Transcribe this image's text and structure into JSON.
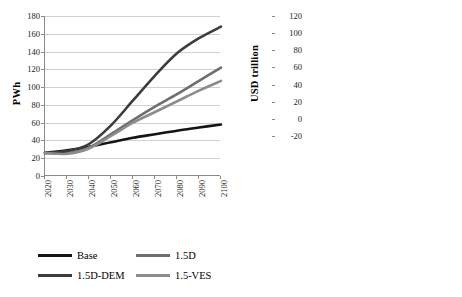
{
  "chart_data": [
    {
      "type": "line",
      "id": "primary-energy-lines",
      "title": "",
      "xlabel": "",
      "ylabel": "PWh",
      "xlim": [
        2020,
        2100
      ],
      "ylim": [
        0,
        180
      ],
      "ytick_step": 20,
      "grid": true,
      "legend_position": "bottom",
      "x": [
        2020,
        2030,
        2040,
        2050,
        2060,
        2070,
        2080,
        2090,
        2100
      ],
      "yticks": [
        "0",
        "20",
        "40",
        "60",
        "80",
        "100",
        "120",
        "140",
        "160",
        "180"
      ],
      "xticks": [
        "2020",
        "2030",
        "2040",
        "2050",
        "2060",
        "2070",
        "2080",
        "2090",
        "2100"
      ],
      "series": [
        {
          "name": "Base",
          "color": "#141414",
          "width": 2.6,
          "values": [
            26,
            29,
            33,
            38,
            43,
            47,
            51,
            54.5,
            58
          ]
        },
        {
          "name": "1.5D",
          "color": "#6e6e6e",
          "width": 2.6,
          "values": [
            26,
            25.5,
            32,
            47,
            63,
            78,
            92,
            107,
            122
          ]
        },
        {
          "name": "1.5D-DEM",
          "color": "#3c3c3c",
          "width": 2.6,
          "values": [
            26,
            28,
            36,
            57,
            85,
            113,
            138,
            155,
            168
          ]
        },
        {
          "name": "1.5-VES",
          "color": "#8c8c8c",
          "width": 2.6,
          "values": [
            26,
            25,
            31,
            45,
            60,
            72,
            84,
            96,
            107
          ]
        }
      ]
    },
    {
      "type": "bar",
      "id": "investment-stacked-bars",
      "subtype": "stacked",
      "title": "",
      "xlabel": "",
      "ylabel": "USD trillion",
      "ylim": [
        -20,
        120
      ],
      "ytick_step": 20,
      "grid": true,
      "legend_position": "bottom",
      "yticks": [
        "-20",
        "0",
        "20",
        "40",
        "60",
        "80",
        "100",
        "120"
      ],
      "periods": [
        "2020-\n2040",
        "2040-\n2060",
        "2060-\n2080",
        "2080-\n2100"
      ],
      "period_labels": [
        {
          "line1": "2020-",
          "line2": "2040"
        },
        {
          "line1": "2040-",
          "line2": "2060"
        },
        {
          "line1": "2060-",
          "line2": "2080"
        },
        {
          "line1": "2080-",
          "line2": "2100"
        }
      ],
      "scenarios": [
        "1.5D",
        "1.5D-DEM",
        "1.5D-VES"
      ],
      "categories": [
        "2020-2040 / 1.5D",
        "2020-2040 / 1.5D-DEM",
        "2020-2040 / 1.5D-VES",
        "2040-2060 / 1.5D",
        "2040-2060 / 1.5D-DEM",
        "2040-2060 / 1.5D-VES",
        "2060-2080 / 1.5D",
        "2060-2080 / 1.5D-DEM",
        "2060-2080 / 1.5D-VES",
        "2080-2100 / 1.5D",
        "2080-2100 / 1.5D-DEM",
        "2080-2100 / 1.5D-VES"
      ],
      "series": [
        {
          "name": "Coal w/o CCS",
          "color": "#101010",
          "values": [
            -3.5,
            -2.0,
            -3.0,
            -5.0,
            -5.5,
            -5.0,
            -5.5,
            -6.0,
            -5.5,
            -5.5,
            -6.0,
            -6.0
          ]
        },
        {
          "name": "Gas w/o CCS",
          "color": "#5a5a5a",
          "values": [
            1.0,
            1.0,
            1.0,
            1.0,
            1.0,
            1.0,
            1.0,
            1.0,
            1.0,
            1.0,
            1.0,
            1.0
          ]
        },
        {
          "name": "Fossil CCS",
          "color": "#c4c4c4",
          "values": [
            3.0,
            4.0,
            3.0,
            6.0,
            7.0,
            6.0,
            7.0,
            8.0,
            7.0,
            7.0,
            9.0,
            8.0
          ]
        },
        {
          "name": "Nuclear",
          "color": "#6b6b6b",
          "values": [
            1.5,
            1.5,
            1.5,
            2.0,
            2.0,
            2.0,
            2.0,
            2.0,
            2.0,
            2.0,
            2.0,
            2.0
          ]
        },
        {
          "name": "Renewables",
          "color": "#3a3a3a",
          "values": [
            9.5,
            22.5,
            9.5,
            28.0,
            53.0,
            24.5,
            39.5,
            98.0,
            37.5,
            43.0,
            104.5,
            63.0
          ]
        },
        {
          "name": "BECCS",
          "color": "#2b2b2b",
          "values": [
            0.0,
            0.0,
            0.0,
            1.0,
            1.0,
            1.0,
            1.0,
            1.5,
            1.0,
            1.0,
            1.5,
            1.0
          ]
        }
      ],
      "bar_totals": [
        15,
        29,
        15,
        38,
        64,
        34.5,
        50,
        110.5,
        48.5,
        53.5,
        117,
        75
      ]
    }
  ],
  "left_chart": {
    "y_axis_title": "PWh",
    "y_ticks": [
      "180",
      "160",
      "140",
      "120",
      "100",
      "80",
      "60",
      "40",
      "20",
      "0"
    ],
    "x_ticks": [
      "2020",
      "2030",
      "2040",
      "2050",
      "2060",
      "2070",
      "2080",
      "2090",
      "2100"
    ],
    "legend": [
      {
        "label": "Base",
        "color": "#141414"
      },
      {
        "label": "1.5D",
        "color": "#6e6e6e"
      },
      {
        "label": "1.5D-DEM",
        "color": "#3c3c3c"
      },
      {
        "label": "1.5-VES",
        "color": "#8c8c8c"
      }
    ]
  },
  "right_chart": {
    "y_axis_title": "USD trillion",
    "y_ticks": [
      "120",
      "100",
      "80",
      "60",
      "40",
      "20",
      "0",
      "-20"
    ],
    "scenario_labels": [
      "1.5D",
      "1.5D-DEM",
      "1.5D-VES",
      "1.5D",
      "1.5D-DEM",
      "1.5D-VES",
      "1.5D",
      "1.5D-DEM",
      "1.5D-VES",
      "1.5D",
      "1.5D-DEM",
      "1.5D-VES"
    ],
    "period_line1": [
      "2020-",
      "2040-",
      "2060-",
      "2080-"
    ],
    "period_line2": [
      "2040",
      "2060",
      "2080",
      "2100"
    ],
    "legend": [
      {
        "label": "Coal w/o CCS",
        "color": "#101010"
      },
      {
        "label": "Gas w/o CCS",
        "color": "#5a5a5a"
      },
      {
        "label": "Fossil CCS",
        "color": "#c4c4c4"
      },
      {
        "label": "Nuclear",
        "color": "#6b6b6b"
      },
      {
        "label": "Renewables",
        "color": "#3a3a3a"
      },
      {
        "label": "BECCS",
        "color": "#2b2b2b"
      }
    ]
  }
}
